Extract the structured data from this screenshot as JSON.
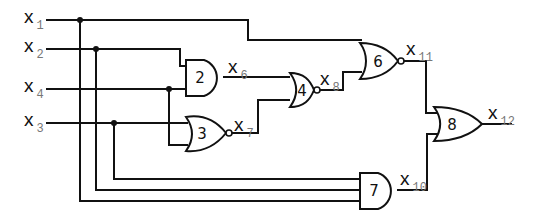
{
  "diagram": {
    "type": "logic-circuit",
    "inputs": [
      {
        "name": "x",
        "sub": "1",
        "y": 20
      },
      {
        "name": "x",
        "sub": "2",
        "y": 49
      },
      {
        "name": "x",
        "sub": "4",
        "y": 89
      },
      {
        "name": "x",
        "sub": "3",
        "y": 123
      }
    ],
    "gates": [
      {
        "id": "2",
        "type": "AND",
        "inputs": [
          "x2",
          "x4"
        ],
        "output": "x6"
      },
      {
        "id": "3",
        "type": "NOR",
        "inputs": [
          "x3",
          "x4"
        ],
        "output": "x7"
      },
      {
        "id": "4",
        "type": "NOR",
        "inputs": [
          "x6",
          "x7"
        ],
        "output": "x8"
      },
      {
        "id": "6",
        "type": "NOR",
        "inputs": [
          "x1",
          "x8"
        ],
        "output": "x11"
      },
      {
        "id": "7",
        "type": "AND",
        "inputs": [
          "x3",
          "x2",
          "x1"
        ],
        "output": "x10"
      },
      {
        "id": "8",
        "type": "OR",
        "inputs": [
          "x11",
          "x10"
        ],
        "output": "x12"
      }
    ],
    "signal_labels": {
      "x6": {
        "name": "x",
        "sub": "6"
      },
      "x7": {
        "name": "x",
        "sub": "7"
      },
      "x8": {
        "name": "x",
        "sub": "8"
      },
      "x10": {
        "name": "x",
        "sub": "10"
      },
      "x11": {
        "name": "x",
        "sub": "11"
      },
      "x12": {
        "name": "x",
        "sub": "12"
      }
    },
    "gate_labels": {
      "g2": "2",
      "g3": "3",
      "g4": "4",
      "g6": "6",
      "g7": "7",
      "g8": "8"
    }
  }
}
